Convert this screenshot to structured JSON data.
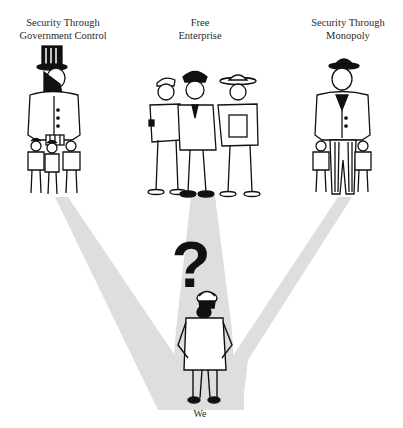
{
  "choices": [
    {
      "id": "government",
      "label_lines": [
        "Security Through",
        "Government Control"
      ]
    },
    {
      "id": "free",
      "label_lines": [
        "Free",
        "Enterprise"
      ]
    },
    {
      "id": "monopoly",
      "label_lines": [
        "Security Through",
        "Monopoly"
      ]
    }
  ],
  "center": {
    "symbol": "?",
    "label": "We"
  },
  "colors": {
    "beam": "#dcdcdc",
    "ink": "#111111",
    "paper": "#ffffff"
  }
}
